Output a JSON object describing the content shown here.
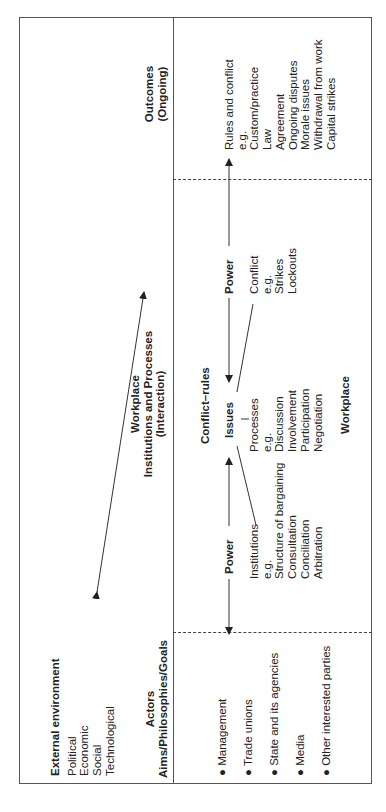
{
  "external": {
    "title": "External environment",
    "items": [
      "Political",
      "Economic",
      "Social",
      "Technological"
    ]
  },
  "actors": {
    "title": "Actors",
    "subtitle": "Aims/Philosophies/Goals",
    "items": [
      "Management",
      "Trade unions",
      "State and its agencies",
      "Media",
      "Other interested parties"
    ]
  },
  "workplace_header": {
    "line1": "Workplace",
    "line2": "Institutions and Processes",
    "line3": "(Interaction)"
  },
  "outcomes_header": {
    "line1": "Outcomes",
    "line2": "(Ongoing)"
  },
  "power_left": "Power",
  "power_right": "Power",
  "issues": "Issues",
  "conflict_rules": "Conflict–rules",
  "workplace_label": "Workplace",
  "institutions": {
    "title": "Institutions",
    "items": [
      "e.g.",
      "Structure of bargaining",
      "Consultation",
      "Conciliation",
      "Arbitration"
    ]
  },
  "processes": {
    "title": "Processes",
    "items": [
      "e.g.",
      "Discussion",
      "Involvement",
      "Participation",
      "Negotiation"
    ]
  },
  "conflict": {
    "title": "Conflict",
    "items": [
      "e.g.",
      "Strikes",
      "Lockouts"
    ]
  },
  "outcomes": {
    "title": "Rules and conflict",
    "items": [
      "e.g.",
      "Custom/practice",
      "Law",
      "Agreement",
      "Ongoing disputes",
      "Morale issues",
      "Withdrawal from work",
      "Capital strikes"
    ]
  }
}
